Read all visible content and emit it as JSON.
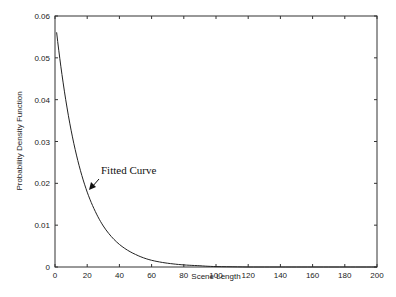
{
  "chart_data": {
    "type": "line",
    "title": "",
    "xlabel": "Scene Length",
    "ylabel": "Probability Density Function",
    "xlim": [
      0,
      200
    ],
    "ylim": [
      0,
      0.06
    ],
    "x_ticks": [
      "0",
      "20",
      "40",
      "60",
      "80",
      "100",
      "120",
      "140",
      "160",
      "180",
      "200"
    ],
    "y_ticks": [
      "0",
      "0.01",
      "0.02",
      "0.03",
      "0.04",
      "0.05",
      "0.06"
    ],
    "grid": false,
    "legend": null,
    "series": [
      {
        "name": "Fitted Curve",
        "x": [
          1,
          5,
          10,
          15,
          20,
          25,
          30,
          40,
          50,
          60,
          70,
          80,
          90,
          100,
          120,
          140,
          160,
          180,
          200
        ],
        "values": [
          0.0561,
          0.0442,
          0.0327,
          0.0242,
          0.0179,
          0.0133,
          0.0098,
          0.0054,
          0.003,
          0.0016,
          0.0009,
          0.0005,
          0.0003,
          0.0001,
          0.0,
          0.0,
          0.0,
          0.0,
          0.0
        ]
      }
    ],
    "annotations": [
      {
        "text": "Fitted Curve",
        "arrow_to": {
          "x": 22,
          "y": 0.0185
        }
      }
    ]
  }
}
